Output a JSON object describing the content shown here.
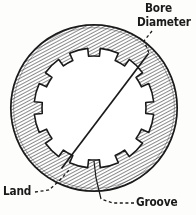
{
  "figure": {
    "type": "technical-line-drawing",
    "width": 196,
    "height": 215,
    "background_color": "#fdfdfb",
    "ink_color": "#1a1a1a"
  },
  "labels": {
    "bore": "Bore",
    "diameter": "Diameter",
    "land": "Land",
    "groove": "Groove"
  },
  "geometry": {
    "outer_circle": {
      "cx": 94,
      "cy": 108,
      "r": 84,
      "stroke": "#1a1a1a",
      "stroke_width": 1.6
    },
    "hatching": {
      "angle_deg": 62,
      "spacing_px": 2.1,
      "color": "#3a3a3a",
      "stroke_width": 0.9
    },
    "bore": {
      "cx": 94,
      "cy": 108,
      "root_radius": 52,
      "groove_radius": 60,
      "groove_count": 12,
      "groove_half_angle_deg": 9,
      "start_angle_deg": -75,
      "stroke": "#1a1a1a",
      "stroke_width": 1.5,
      "fill": "#ffffff"
    },
    "diameter_line": {
      "x1": 148,
      "y1": 54,
      "x2": 62,
      "y2": 168,
      "stroke": "#1a1a1a",
      "stroke_width": 1.6
    }
  },
  "leaders": {
    "bore_diameter": {
      "style": "dashed",
      "dash": "3,2.5",
      "points": "150,30 145,40 149,53"
    },
    "land": {
      "style": "dashed",
      "dash": "3,2.5",
      "points": "34,192 48,189 62,176 70,168"
    },
    "groove": {
      "style": "dashed",
      "dash": "3,2.5",
      "points": "134,203 112,203 100,200"
    },
    "groove_stem": {
      "style": "solid",
      "points": "100,200 95,162"
    }
  }
}
